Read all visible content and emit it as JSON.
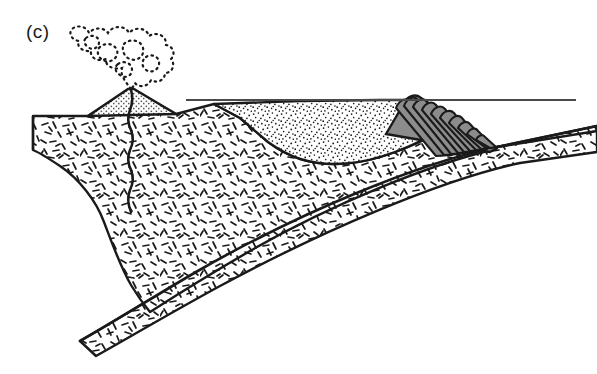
{
  "figure": {
    "panel_label": "(c)",
    "type": "geological-cross-section",
    "width": 597,
    "height": 374,
    "background_color": "#ffffff",
    "line_color": "#1a1a1a"
  },
  "colors": {
    "outline": "#1a1a1a",
    "sea_level_line": "#4a4a4a",
    "wedge_slice_fill": "#8c8c8c",
    "wedge_slice_stroke": "#1a1a1a",
    "volcano_cone_fill": "#b5b5b5",
    "crust_fill": "#ffffff",
    "basin_fill": "#ffffff",
    "slab_fill": "#ffffff",
    "stipple_dot": "#1a1a1a",
    "dash_texture": "#1a1a1a"
  },
  "elements": {
    "eruption_cloud": {
      "name": "eruption-cloud",
      "description": "billowing ash plume drawn as a dotted, lobed outline rising from the volcano summit",
      "style": "dotted outline, unfilled",
      "bbox": [
        52,
        22,
        170,
        92
      ]
    },
    "volcano": {
      "name": "volcano-cone",
      "description": "volcanic arc edifice with fine cross-hatched / speckled fill",
      "summit": [
        131,
        88
      ],
      "base_left": [
        88,
        116
      ],
      "base_right": [
        181,
        116
      ],
      "fill": "fine-stipple-gray"
    },
    "magma_conduit": {
      "name": "magma-conduit",
      "description": "thin wavy vertical feeder conduit below the volcano",
      "top": [
        131,
        90
      ],
      "bottom": [
        131,
        212
      ]
    },
    "upper_plate_crust": {
      "name": "upper-plate-crust",
      "description": "overriding continental crust block with short random dash texture",
      "texture": "random-dashes",
      "surface_left": [
        33,
        115
      ],
      "base_depth_left": 152
    },
    "forearc_basin": {
      "name": "forearc-basin-sediments",
      "description": "fore-arc basin sediment wedge with fine random dot stipple, bowl-shaped floor",
      "texture": "fine-dot-stipple",
      "left_margin_top": [
        214,
        104
      ],
      "floor_low_point": [
        330,
        163
      ],
      "right_edge": [
        425,
        104
      ]
    },
    "sea_level": {
      "name": "sea-level-line",
      "description": "thin horizontal water surface line",
      "y": 100,
      "x_start": 186,
      "x_end": 576
    },
    "accretionary_wedge": {
      "name": "accretionary-wedge",
      "description": "imbricate stack of gray thrust slices at the trench inner wall",
      "slice_count": 10,
      "crest": [
        418,
        96
      ],
      "toe": [
        496,
        148
      ],
      "slice_fill": "#8c8c8c"
    },
    "subducting_slab": {
      "name": "subducting-oceanic-slab",
      "description": "descending oceanic plate, a dash-textured band dipping to the lower left beneath the upper plate",
      "texture": "random-dashes",
      "top_right": [
        597,
        130
      ],
      "lower_left_tip": [
        80,
        340
      ]
    },
    "oceanic_plate_surface": {
      "name": "oceanic-plate-seafloor",
      "description": "seafloor top of the incoming oceanic plate right of the trench",
      "from": [
        497,
        147
      ],
      "to": [
        597,
        131
      ]
    },
    "trench": {
      "name": "trench-axis",
      "description": "trench where the oceanic plate bends beneath the accretionary wedge toe",
      "position": [
        496,
        148
      ]
    }
  }
}
